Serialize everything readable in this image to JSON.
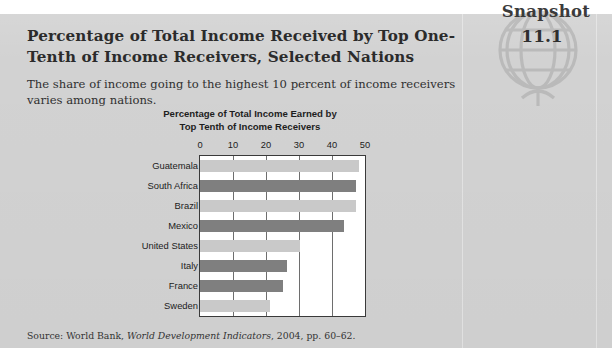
{
  "badge": {
    "label": "Snapshot",
    "number": "11.1",
    "icon": "globe-icon"
  },
  "heading": {
    "title": "Percentage of Total Income Received by Top One-Tenth of Income Receivers, Selected Nations",
    "subtitle": "The share of income going to the highest 10 percent of income receivers varies among nations."
  },
  "source": {
    "prefix": "Source: World Bank, ",
    "italic": "World Development Indicators",
    "suffix": ", 2004, pp. 60–62."
  },
  "colors": {
    "panel": "#d2d2d2",
    "bar_light": "#c9c9c9",
    "bar_dark": "#7f7f7f",
    "plot_background": "#ffffff",
    "axis": "#3a3a3a",
    "gridline": "#6e6e6e",
    "text": "#2b2b2b"
  },
  "chart_data": {
    "type": "bar",
    "orientation": "horizontal",
    "title": "Percentage of Total Income Earned by Top Tenth of Income Receivers",
    "title_line1": "Percentage of Total Income Earned by",
    "title_line2": "Top Tenth of Income Receivers",
    "xlabel": "",
    "ylabel": "",
    "xlim": [
      0,
      50
    ],
    "xticks": [
      0,
      10,
      20,
      30,
      40,
      50
    ],
    "tick_labels": [
      "0",
      "10",
      "20",
      "30",
      "40",
      "50"
    ],
    "grid": true,
    "grid_axis": "x",
    "legend": false,
    "categories": [
      "Guatemala",
      "South Africa",
      "Brazil",
      "Mexico",
      "United States",
      "Italy",
      "France",
      "Sweden"
    ],
    "values": [
      48.2,
      47.3,
      47.2,
      43.7,
      30.2,
      26.3,
      25.2,
      21.3
    ],
    "bar_shades": [
      "light",
      "dark",
      "light",
      "dark",
      "light",
      "dark",
      "dark",
      "light"
    ]
  }
}
